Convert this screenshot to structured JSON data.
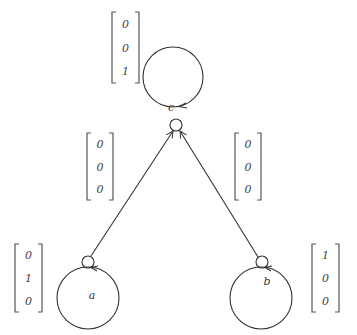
{
  "diagram": {
    "nodes": [
      {
        "id": "c",
        "label": "c",
        "cx": 173,
        "cy": 77,
        "r": 30,
        "port": {
          "cx": 176,
          "cy": 125,
          "r": 6
        },
        "label_pos": [
          171,
          111
        ],
        "vector": {
          "values": [
            "0",
            "0",
            "1"
          ],
          "x": 112,
          "y": 12,
          "w": 27,
          "h": 71
        }
      },
      {
        "id": "a",
        "label": "a",
        "cx": 88,
        "cy": 298,
        "r": 31,
        "port": {
          "cx": 88,
          "cy": 262,
          "r": 6
        },
        "label_pos": [
          92,
          299
        ],
        "vector": {
          "values": [
            "0",
            "1",
            "0"
          ],
          "x": 15,
          "y": 244,
          "w": 27,
          "h": 68
        }
      },
      {
        "id": "b",
        "label": "b",
        "cx": 261,
        "cy": 298,
        "r": 31,
        "port": {
          "cx": 262,
          "cy": 262,
          "r": 6
        },
        "label_pos": [
          267,
          285
        ],
        "vector": {
          "values": [
            "1",
            "0",
            "0"
          ],
          "x": 312,
          "y": 244,
          "w": 27,
          "h": 68
        }
      }
    ],
    "edges": [
      {
        "from": "a",
        "to": "c",
        "x1": 91,
        "y1": 256,
        "x2": 173,
        "y2": 131,
        "vector": {
          "values": [
            "0",
            "0",
            "0"
          ],
          "x": 87,
          "y": 133,
          "w": 26,
          "h": 67
        }
      },
      {
        "from": "b",
        "to": "c",
        "x1": 258,
        "y1": 257,
        "x2": 180,
        "y2": 131,
        "vector": {
          "values": [
            "0",
            "0",
            "0"
          ],
          "x": 235,
          "y": 133,
          "w": 26,
          "h": 67
        }
      }
    ]
  }
}
